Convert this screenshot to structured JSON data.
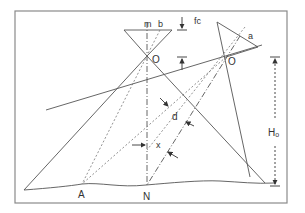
{
  "diagram": {
    "colors": {
      "line": "#555555",
      "frame": "#8a8a8a",
      "text": "#333333"
    },
    "labels": {
      "m": "m",
      "b": "b",
      "fc": "fc",
      "o_vertical": "O",
      "o_tilted": "O",
      "a": "a",
      "d": "d",
      "x": "x",
      "ho": "Ho",
      "ho_main": "H",
      "ho_sub": "o",
      "A": "A",
      "N": "N"
    }
  }
}
